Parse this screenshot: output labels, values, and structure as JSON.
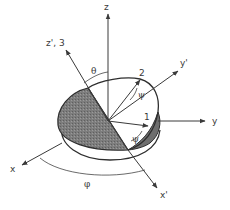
{
  "diagram": {
    "type": "euler-angle-coordinate-diagram",
    "colors": {
      "ink": "#3a3a3a",
      "shaded_half": "#7d7d7d",
      "background": "#ffffff"
    },
    "axes": {
      "z": "z",
      "z_prime_3": "z', 3",
      "y_prime": "y'",
      "y": "y",
      "x": "x",
      "x_prime": "x'",
      "body_1": "1",
      "body_2": "2"
    },
    "angles": {
      "theta": "θ",
      "psi_upper": "ψ",
      "psi_lower": "ψ",
      "phi": "φ"
    }
  }
}
